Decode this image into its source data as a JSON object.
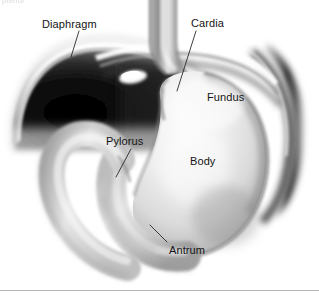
{
  "figure": {
    "modality": "grayscale anatomical illustration",
    "width": 319,
    "height": 299,
    "background_color": "#ffffff",
    "border_color": "#b6b6b6",
    "clipped_caption": "pterior"
  },
  "labels": [
    {
      "id": "diaphragm",
      "text": "Diaphragm",
      "left": 42,
      "top": 18
    },
    {
      "id": "cardia",
      "text": "Cardia",
      "left": 191,
      "top": 17
    },
    {
      "id": "fundus",
      "text": "Fundus",
      "left": 207,
      "top": 91
    },
    {
      "id": "pylorus",
      "text": "Pylorus",
      "left": 106,
      "top": 135
    },
    {
      "id": "body",
      "text": "Body",
      "left": 190,
      "top": 155
    },
    {
      "id": "antrum",
      "text": "Antrum",
      "left": 169,
      "top": 244
    }
  ],
  "leader_lines": [
    {
      "id": "leader-diaphragm",
      "x1": 79,
      "y1": 31,
      "x2": 71,
      "y2": 57
    },
    {
      "id": "leader-cardia",
      "x1": 196,
      "y1": 31,
      "x2": 177,
      "y2": 91
    },
    {
      "id": "leader-pylorus",
      "x1": 131,
      "y1": 149,
      "x2": 116,
      "y2": 177
    },
    {
      "id": "leader-antrum",
      "x1": 167,
      "y1": 242,
      "x2": 150,
      "y2": 225
    }
  ],
  "structures": [
    {
      "id": "diaphragm-dome",
      "name": "Diaphragm",
      "tone": "dark"
    },
    {
      "id": "esophagus",
      "name": "Esophagus",
      "tone": "light-gray"
    },
    {
      "id": "gastric-fundus",
      "name": "Fundus",
      "tone": "light"
    },
    {
      "id": "gastric-body",
      "name": "Body",
      "tone": "light"
    },
    {
      "id": "gastric-antrum",
      "name": "Antrum",
      "tone": "mid-gray"
    },
    {
      "id": "pyloric-canal",
      "name": "Pylorus",
      "tone": "mid-gray"
    },
    {
      "id": "duodenal-bulb",
      "name": "Duodenum",
      "tone": "light-gray"
    },
    {
      "id": "gas-bubble",
      "name": "Gas bubble",
      "tone": "white"
    }
  ],
  "colors": {
    "ink": "#141414",
    "leader": "#2a2a2a",
    "rule": "#b6b6b6",
    "dark_dome": "#111111",
    "mid_gray": "#9a9a9a",
    "light_gray": "#d8d8d8",
    "pale": "#f1f1f1"
  }
}
